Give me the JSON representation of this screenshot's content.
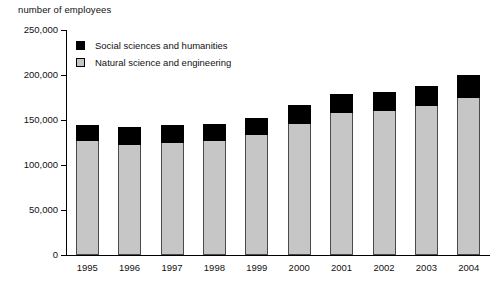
{
  "chart_data": {
    "type": "bar",
    "stacked": true,
    "title": "",
    "ylabel": "number of employees",
    "xlabel": "",
    "ylim": [
      0,
      250000
    ],
    "ytick_values": [
      0,
      50000,
      100000,
      150000,
      200000,
      250000
    ],
    "ytick_labels": [
      "0",
      "50,000",
      "100,000",
      "150,000",
      "200,000",
      "250,000"
    ],
    "grid": false,
    "legend_position": "upper-left-inside",
    "categories": [
      "1995",
      "1996",
      "1997",
      "1998",
      "1999",
      "2000",
      "2001",
      "2002",
      "2003",
      "2004"
    ],
    "series": [
      {
        "name": "Natural science and engineering",
        "color": "#c6c6c6",
        "values": [
          127000,
          122000,
          124000,
          127000,
          133000,
          146000,
          158000,
          160000,
          166000,
          174000
        ]
      },
      {
        "name": "Social sciences and humanities",
        "color": "#000000",
        "values": [
          17000,
          20000,
          20000,
          19000,
          19000,
          21000,
          21000,
          21000,
          22000,
          26000
        ]
      }
    ],
    "totals": [
      144000,
      142000,
      144000,
      146000,
      152000,
      167000,
      179000,
      181000,
      188000,
      200000
    ]
  },
  "legend": {
    "items": [
      {
        "label": "Social sciences and humanities",
        "color": "#000000"
      },
      {
        "label": "Natural science and engineering",
        "color": "#c6c6c6"
      }
    ]
  }
}
